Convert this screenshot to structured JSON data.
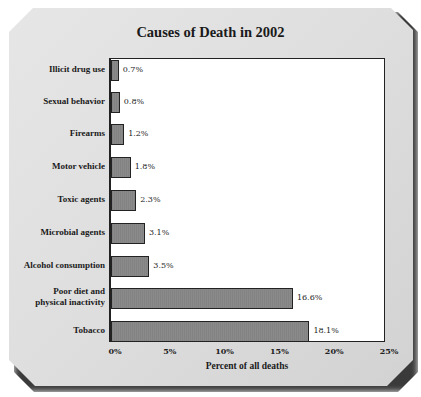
{
  "chart_data": {
    "type": "bar",
    "orientation": "horizontal",
    "title": "Causes of Death in 2002",
    "xlabel": "Percent of all deaths",
    "ylabel": "",
    "xlim": [
      0,
      25
    ],
    "x_ticks": [
      "0%",
      "5%",
      "10%",
      "15%",
      "20%",
      "25%"
    ],
    "grid": false,
    "legend": null,
    "categories": [
      "Illicit drug use",
      "Sexual behavior",
      "Firearms",
      "Motor vehicle",
      "Toxic agents",
      "Microbial agents",
      "Alcohol consumption",
      "Poor diet and\nphysical inactivity",
      "Tobacco"
    ],
    "values": [
      0.7,
      0.8,
      1.2,
      1.8,
      2.3,
      3.1,
      3.5,
      16.6,
      18.1
    ],
    "value_labels": [
      "0.7%",
      "0.8%",
      "1.2%",
      "1.8%",
      "2.3%",
      "3.1%",
      "3.5%",
      "16.6%",
      "18.1%"
    ],
    "bar_color": "#8a8a8a"
  }
}
